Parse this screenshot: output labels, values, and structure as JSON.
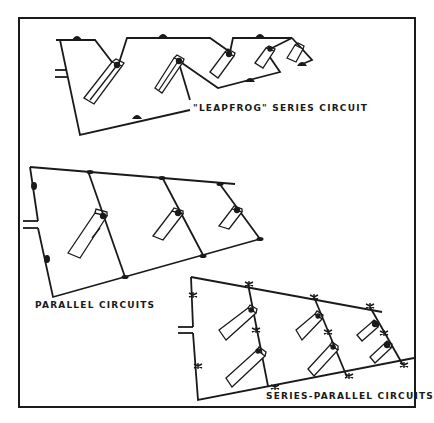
{
  "diagram": {
    "frame_color": "#1a1a1a",
    "line_color": "#1a1a1a",
    "background": "#ffffff",
    "sections": [
      {
        "id": "leapfrog",
        "label": "\"LEAPFROG\" SERIES CIRCUIT",
        "bulbs": 5,
        "lamp_sockets": 5
      },
      {
        "id": "parallel",
        "label": "PARALLEL CIRCUITS",
        "bulbs": 3,
        "lamp_sockets": 2
      },
      {
        "id": "series_parallel",
        "label": "SERIES-PARALLEL CIRCUITS",
        "bulbs": 6,
        "lamp_sockets": 2
      }
    ]
  }
}
